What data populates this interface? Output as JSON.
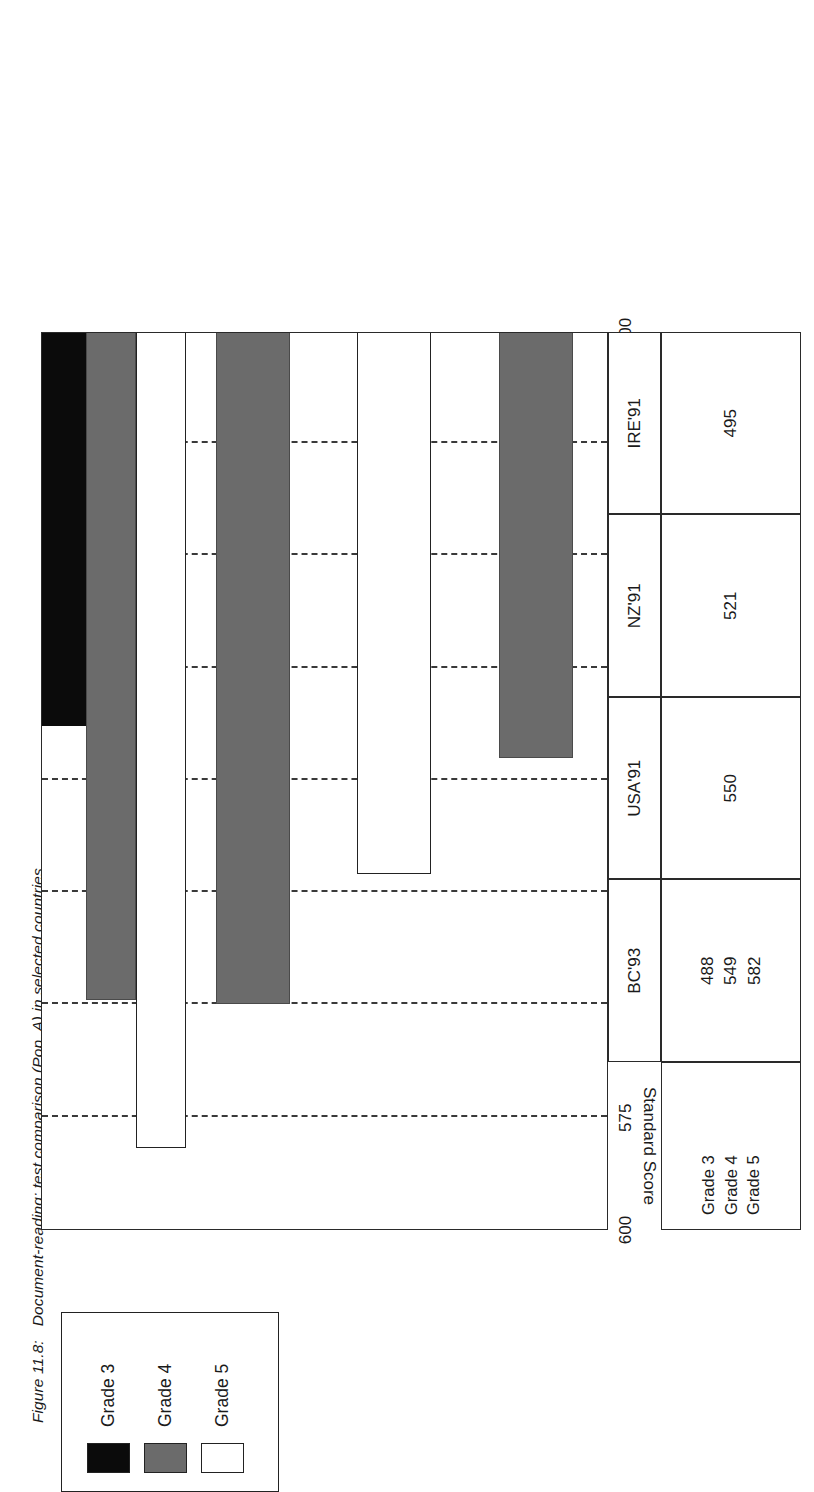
{
  "caption": {
    "number": "Figure 11.8:",
    "text": "Document-reading: test comparison (Pop. A) in selected countries"
  },
  "legend": {
    "items": [
      {
        "label": "Grade 3",
        "swatch": "black",
        "color": "#0b0b0b",
        "icon": "legend-swatch-icon"
      },
      {
        "label": "Grade 4",
        "swatch": "gray",
        "color": "#6b6b6b",
        "icon": "legend-swatch-icon"
      },
      {
        "label": "Grade 5",
        "swatch": "white",
        "color": "#ffffff",
        "icon": "legend-swatch-icon"
      }
    ]
  },
  "table": {
    "row_headers": [
      "Grade 3",
      "Grade 4",
      "Grade 5"
    ],
    "columns": [
      {
        "country": "BC'93",
        "cells": [
          "488",
          "549",
          "582"
        ]
      },
      {
        "country": "USA'91",
        "cells": [
          "550"
        ]
      },
      {
        "country": "NZ'91",
        "cells": [
          "521"
        ]
      },
      {
        "country": "IRE'91",
        "cells": [
          "495"
        ]
      }
    ]
  },
  "chart_data": {
    "type": "bar",
    "orientation": "horizontal",
    "title": "",
    "xlabel": "",
    "ylabel": "Standard Score",
    "ylim": [
      400,
      600
    ],
    "ticks": [
      "600",
      "575",
      "550",
      "525",
      "500",
      "475",
      "450",
      "425",
      "400"
    ],
    "tick_values": [
      600,
      575,
      550,
      525,
      500,
      475,
      450,
      425,
      400
    ],
    "grid": "dashed-vertical",
    "legend_position": "above-plot",
    "categories": [
      "BC'93",
      "USA'91",
      "NZ'91",
      "IRE'91"
    ],
    "series": [
      {
        "name": "Grade 3",
        "color": "#0b0b0b",
        "values": [
          488,
          null,
          null,
          null
        ]
      },
      {
        "name": "Grade 4",
        "color": "#6b6b6b",
        "values": [
          549,
          550,
          null,
          495
        ]
      },
      {
        "name": "Grade 5",
        "color": "#ffffff",
        "values": [
          582,
          null,
          521,
          null
        ]
      }
    ]
  }
}
